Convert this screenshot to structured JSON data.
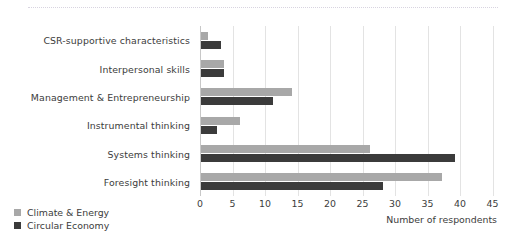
{
  "chart_data": {
    "type": "bar",
    "orientation": "horizontal",
    "title": "",
    "xlabel": "Number of respondents",
    "ylabel": "",
    "xlim": [
      0,
      45
    ],
    "xticks": [
      0,
      5,
      10,
      15,
      20,
      25,
      30,
      35,
      40,
      45
    ],
    "grid": true,
    "legend_position": "bottom-left",
    "categories": [
      "CSR-supportive characteristics",
      "Interpersonal skills",
      "Management & Entrepreneurship",
      "Instrumental thinking",
      "Systems thinking",
      "Foresight thinking"
    ],
    "series": [
      {
        "name": "Climate & Energy",
        "color": "#a8a8a8",
        "values": [
          1,
          3.5,
          14,
          6,
          26,
          37
        ]
      },
      {
        "name": "Circular Economy",
        "color": "#3b3b3b",
        "values": [
          3,
          3.5,
          11,
          2.5,
          39,
          28
        ]
      }
    ]
  },
  "axis": {
    "ticks": [
      "0",
      "5",
      "10",
      "15",
      "20",
      "25",
      "30",
      "35",
      "40",
      "45"
    ],
    "title": "Number of respondents"
  },
  "legend": {
    "items": [
      {
        "label": "Climate & Energy",
        "color": "#a8a8a8"
      },
      {
        "label": "Circular Economy",
        "color": "#3b3b3b"
      }
    ]
  }
}
